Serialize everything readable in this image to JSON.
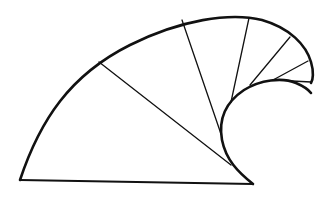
{
  "diagram": {
    "type": "wave-spiral-figure",
    "stroke_color": "#111111",
    "background": "#ffffff",
    "outer_arc": "M20,180 C40,120 70,75 130,45 C180,20 230,12 262,20 C290,28 306,45 311,62 C314,72 313,80 311,83",
    "inner_curve": "M253,184 C238,172 226,160 222,140 C218,118 226,102 244,90 C260,80 282,77 296,83 C303,86 308,89 311,93",
    "base_line": {
      "x1": 20,
      "y1": 180,
      "x2": 253,
      "y2": 184
    },
    "spokes": [
      {
        "x1": 99,
        "y1": 62,
        "x2": 231,
        "y2": 165
      },
      {
        "x1": 182,
        "y1": 20,
        "x2": 221,
        "y2": 134
      },
      {
        "x1": 249,
        "y1": 18,
        "x2": 231,
        "y2": 102
      },
      {
        "x1": 290,
        "y1": 37,
        "x2": 250,
        "y2": 85
      },
      {
        "x1": 308,
        "y1": 61,
        "x2": 273,
        "y2": 80
      },
      {
        "x1": 311,
        "y1": 82,
        "x2": 292,
        "y2": 81
      }
    ]
  }
}
